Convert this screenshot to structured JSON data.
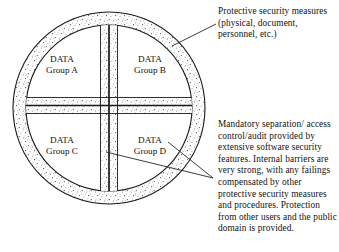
{
  "figure": {
    "colors": {
      "line": "#1a1a1a",
      "stipple": "#555555",
      "background": "#ffffff"
    },
    "circle": {
      "center_x": 109,
      "center_y": 108,
      "outer_radius": 96,
      "inner_radius": 83
    },
    "quadrant_labels": [
      {
        "id": "a",
        "line1": "DATA",
        "line2": "Group A"
      },
      {
        "id": "b",
        "line1": "DATA",
        "line2": "Group B"
      },
      {
        "id": "c",
        "line1": "DATA",
        "line2": "Group C"
      },
      {
        "id": "d",
        "line1": "DATA",
        "line2": "Group D"
      }
    ],
    "annotations": {
      "top": "Protective security measures (physical, document, personnel, etc.)",
      "bottom": "Mandatory separation/ access control/audit provided by extensive software security features. Internal barriers are very strong, with any failings compensated by other protective security measures and procedures. Protection from other users and the public domain is provided."
    },
    "leader_lines": [
      {
        "name": "top-leader",
        "from_x": 172,
        "from_y": 46,
        "to_x": 216,
        "to_y": 24
      },
      {
        "name": "bottom-leader-ring",
        "from_x": 168,
        "from_y": 142,
        "to_x": 213,
        "to_y": 178
      },
      {
        "name": "bottom-leader-barrier",
        "from_x": 106,
        "from_y": 152,
        "to_x": 213,
        "to_y": 178
      }
    ]
  }
}
